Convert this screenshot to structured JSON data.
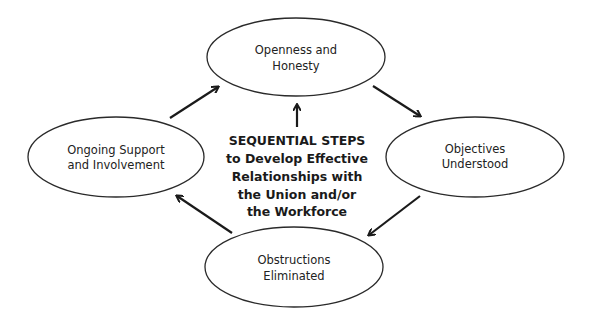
{
  "diagram": {
    "type": "cycle",
    "center": {
      "lines": [
        "SEQUENTIAL STEPS",
        "to Develop Effective",
        "Relationships with",
        "the Union and/or",
        "the Workforce"
      ]
    },
    "nodes": [
      {
        "id": "openness",
        "lines": [
          "Openness and",
          "Honesty"
        ]
      },
      {
        "id": "objectives",
        "lines": [
          "Objectives",
          "Understood"
        ]
      },
      {
        "id": "obstructions",
        "lines": [
          "Obstructions",
          "Eliminated"
        ]
      },
      {
        "id": "ongoing",
        "lines": [
          "Ongoing Support",
          "and Involvement"
        ]
      }
    ],
    "edges": [
      {
        "from": "ongoing",
        "to": "openness"
      },
      {
        "from": "openness",
        "to": "objectives"
      },
      {
        "from": "objectives",
        "to": "obstructions"
      },
      {
        "from": "obstructions",
        "to": "ongoing"
      },
      {
        "from": "center",
        "to": "openness"
      }
    ],
    "colors": {
      "stroke": "#2a2a2a",
      "text": "#222222",
      "background": "#ffffff"
    }
  }
}
